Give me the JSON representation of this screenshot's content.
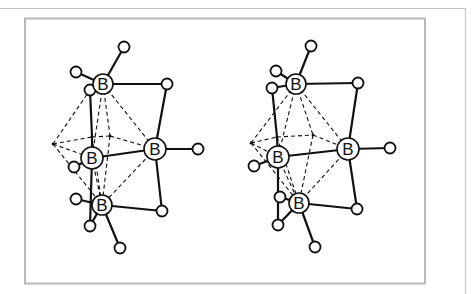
{
  "figure": {
    "type": "stereo-pair molecular diagram",
    "atom_label": "B",
    "colors": {
      "line": "#111111",
      "frame": "#b8b8b8",
      "background": "#ffffff"
    }
  },
  "views": [
    {
      "name": "left-view",
      "boron": [
        {
          "id": "B1",
          "x": 103,
          "y": 84,
          "r": 10
        },
        {
          "id": "B2",
          "x": 92,
          "y": 158,
          "r": 11
        },
        {
          "id": "B3",
          "x": 155,
          "y": 149,
          "r": 11
        },
        {
          "id": "B4",
          "x": 102,
          "y": 205,
          "r": 10
        }
      ],
      "hydrogen": [
        {
          "id": "H1",
          "x": 124,
          "y": 47
        },
        {
          "id": "H2",
          "x": 76,
          "y": 72
        },
        {
          "id": "H3",
          "x": 90,
          "y": 90
        },
        {
          "id": "H4",
          "x": 167,
          "y": 84
        },
        {
          "id": "H5",
          "x": 198,
          "y": 149
        },
        {
          "id": "H6",
          "x": 162,
          "y": 211
        },
        {
          "id": "H7",
          "x": 74,
          "y": 167
        },
        {
          "id": "H8",
          "x": 76,
          "y": 199
        },
        {
          "id": "H9",
          "x": 90,
          "y": 226
        },
        {
          "id": "H10",
          "x": 120,
          "y": 248
        }
      ],
      "points": [
        {
          "id": "P0",
          "x": 53,
          "y": 144
        },
        {
          "id": "P1",
          "x": 92,
          "y": 137
        },
        {
          "id": "P2",
          "x": 110,
          "y": 136
        }
      ],
      "bonds": [
        [
          "B1",
          "H1"
        ],
        [
          "B1",
          "H2"
        ],
        [
          "B1",
          "H3"
        ],
        [
          "B1",
          "H4"
        ],
        [
          "H4",
          "B3"
        ],
        [
          "B3",
          "H5"
        ],
        [
          "B3",
          "H6"
        ],
        [
          "H6",
          "B4"
        ],
        [
          "B2",
          "B3"
        ],
        [
          "B2",
          "H7"
        ],
        [
          "B4",
          "H8"
        ],
        [
          "B4",
          "H9"
        ],
        [
          "B4",
          "H10"
        ],
        [
          "H3",
          "P1"
        ],
        [
          "P1",
          "B2"
        ],
        [
          "B2",
          "H9"
        ]
      ],
      "dashed": [
        [
          "P0",
          "H3"
        ],
        [
          "P0",
          "P1"
        ],
        [
          "P0",
          "B2"
        ],
        [
          "P0",
          "B4"
        ],
        [
          "P1",
          "P2"
        ],
        [
          "P2",
          "B3"
        ],
        [
          "B1",
          "P2"
        ],
        [
          "B1",
          "B3"
        ],
        [
          "B1",
          "B2"
        ],
        [
          "B2",
          "B4"
        ],
        [
          "B3",
          "B4"
        ],
        [
          "P2",
          "B4"
        ],
        [
          "P1",
          "B4"
        ]
      ]
    },
    {
      "name": "right-view",
      "boron": [
        {
          "id": "B1",
          "x": 296,
          "y": 84,
          "r": 10
        },
        {
          "id": "B2",
          "x": 278,
          "y": 157,
          "r": 11
        },
        {
          "id": "B3",
          "x": 348,
          "y": 149,
          "r": 11
        },
        {
          "id": "B4",
          "x": 299,
          "y": 203,
          "r": 10
        }
      ],
      "hydrogen": [
        {
          "id": "H1",
          "x": 311,
          "y": 46
        },
        {
          "id": "H2",
          "x": 276,
          "y": 71
        },
        {
          "id": "H3",
          "x": 272,
          "y": 88
        },
        {
          "id": "H4",
          "x": 358,
          "y": 83
        },
        {
          "id": "H5",
          "x": 390,
          "y": 148
        },
        {
          "id": "H6",
          "x": 357,
          "y": 209
        },
        {
          "id": "H7",
          "x": 254,
          "y": 166
        },
        {
          "id": "H8",
          "x": 280,
          "y": 197
        },
        {
          "id": "H9",
          "x": 278,
          "y": 225
        },
        {
          "id": "H10",
          "x": 315,
          "y": 247
        }
      ],
      "points": [
        {
          "id": "P0",
          "x": 251,
          "y": 143
        },
        {
          "id": "P1",
          "x": 277,
          "y": 137
        },
        {
          "id": "P2",
          "x": 313,
          "y": 135
        }
      ],
      "bonds": [
        [
          "B1",
          "H1"
        ],
        [
          "B1",
          "H2"
        ],
        [
          "B1",
          "H3"
        ],
        [
          "B1",
          "H4"
        ],
        [
          "H4",
          "B3"
        ],
        [
          "B3",
          "H5"
        ],
        [
          "B3",
          "H6"
        ],
        [
          "H6",
          "B4"
        ],
        [
          "B2",
          "B3"
        ],
        [
          "B2",
          "H7"
        ],
        [
          "B4",
          "H8"
        ],
        [
          "B4",
          "H9"
        ],
        [
          "B4",
          "H10"
        ],
        [
          "H3",
          "P1"
        ],
        [
          "P1",
          "B2"
        ],
        [
          "B2",
          "H9"
        ]
      ],
      "dashed": [
        [
          "P0",
          "B1"
        ],
        [
          "P0",
          "P1"
        ],
        [
          "P0",
          "B2"
        ],
        [
          "P0",
          "B4"
        ],
        [
          "P1",
          "P2"
        ],
        [
          "P2",
          "B3"
        ],
        [
          "B1",
          "P2"
        ],
        [
          "B1",
          "B3"
        ],
        [
          "B1",
          "B2"
        ],
        [
          "B2",
          "B4"
        ],
        [
          "B3",
          "B4"
        ],
        [
          "P2",
          "B4"
        ],
        [
          "P1",
          "B4"
        ]
      ]
    }
  ]
}
